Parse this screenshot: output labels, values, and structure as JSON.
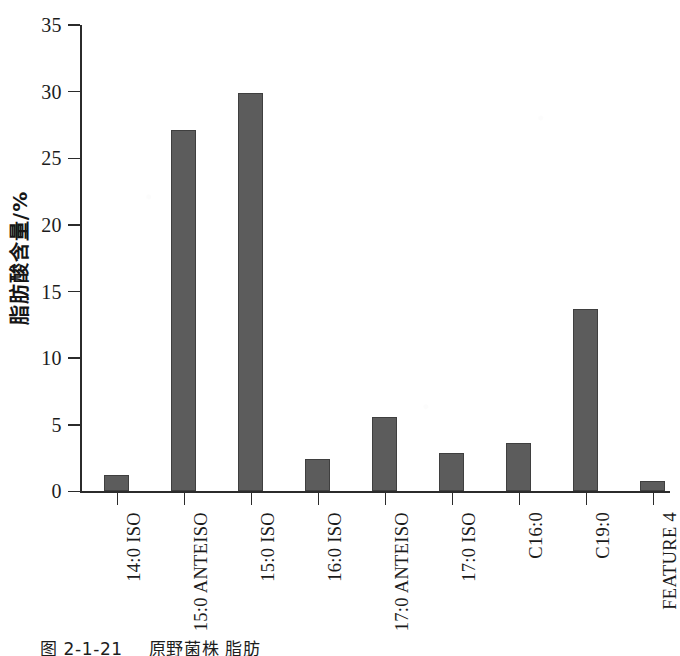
{
  "chart_data": {
    "type": "bar",
    "title": "",
    "xlabel": "",
    "ylabel": "脂肪酸含量/%",
    "ylim": [
      0,
      35
    ],
    "yticks": [
      0,
      5,
      10,
      15,
      20,
      25,
      30,
      35
    ],
    "grid": false,
    "legend": "none",
    "bar_color": "#5c5c5c",
    "categories": [
      "14:0 ISO",
      "15:0 ANTEISO",
      "15:0 ISO",
      "16:0 ISO",
      "17:0 ANTEISO",
      "17:0 ISO",
      "C16:0",
      "C19:0",
      "FEATURE 4"
    ],
    "values": [
      1.2,
      27.1,
      29.9,
      2.4,
      5.6,
      2.9,
      3.6,
      13.7,
      0.8
    ]
  },
  "axis": {
    "y_title": "脂肪酸含量/%",
    "tick_labels": [
      "0",
      "5",
      "10",
      "15",
      "20",
      "25",
      "30",
      "35"
    ]
  },
  "caption": {
    "figure_number": "图 2-1-21",
    "text": "原野菌株 脂肪"
  }
}
